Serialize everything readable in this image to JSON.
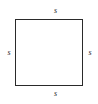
{
  "figure": {
    "kind": "geometry-diagram",
    "shape": "square",
    "background_color": "#ffffff",
    "stroke_color": "#2a2a2a",
    "labels": {
      "top": "s",
      "right": "s",
      "bottom": "s",
      "left": "s"
    }
  }
}
